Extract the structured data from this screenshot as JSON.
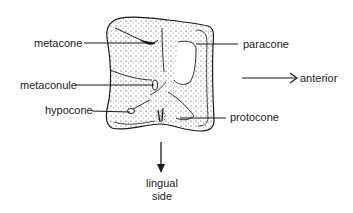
{
  "figure": {
    "line_color": "#1a1a1a",
    "labels": {
      "metacone": "metacone",
      "paracone": "paracone",
      "metaconule": "metaconule",
      "hypocone": "hypocone",
      "protocone": "protocone"
    },
    "directions": {
      "anterior": "anterior",
      "lingual_line1": "lingual",
      "lingual_line2": "side"
    }
  }
}
